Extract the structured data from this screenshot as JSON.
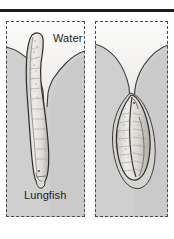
{
  "figure": {
    "title_rule": "horizontal-divider",
    "panels": [
      {
        "id": "left",
        "caption_labels": [
          "Water",
          "Lungfish"
        ],
        "scene": "lungfish descending head-down into a narrow funnel-shaped burrow opening in the mud beneath the water",
        "water_label": "Water",
        "organism_label": "Lungfish"
      },
      {
        "id": "right",
        "scene": "lungfish curled inside an enlarged rounded burrow chamber deep in the mud",
        "water_label": "",
        "organism_label": ""
      }
    ]
  },
  "labels": {
    "water": "Water",
    "lungfish": "Lungfish"
  },
  "colors": {
    "mud": "#cfcfcf",
    "mud_shadow": "#b9b9b9",
    "water": "#f3f2f0",
    "outline": "#2b2b2b",
    "fish_body": "#e6e4e0",
    "fish_shade": "#b4b2ad",
    "panel_border": "#4a4a4a",
    "rule": "#1c1c1c",
    "background": "#ffffff",
    "text": "#1b1b1b"
  }
}
